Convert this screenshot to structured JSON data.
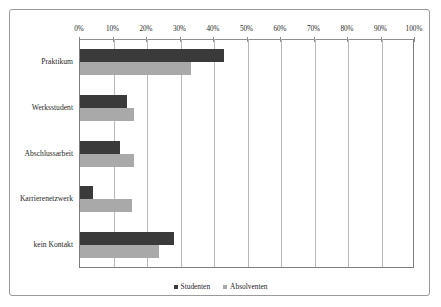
{
  "chart_data": {
    "type": "bar",
    "orientation": "horizontal",
    "title": "",
    "xlabel": "",
    "ylabel": "",
    "xlim": [
      0,
      100
    ],
    "grid": "vertical",
    "legend_position": "bottom",
    "xtick_labels": [
      "0%",
      "10%",
      "20%",
      "30%",
      "40%",
      "50%",
      "60%",
      "70%",
      "80%",
      "90%",
      "100%"
    ],
    "xtick_values": [
      0,
      10,
      20,
      30,
      40,
      50,
      60,
      70,
      80,
      90,
      100
    ],
    "categories": [
      "Praktikum",
      "Werksstudent",
      "Abschlussarbeit",
      "Karrierenetzwerk",
      "kein Kontakt"
    ],
    "series": [
      {
        "name": "Studenten",
        "color": "#3a3a3a",
        "values": [
          43,
          14,
          12,
          4,
          28
        ]
      },
      {
        "name": "Absolventen",
        "color": "#a9a9a9",
        "values": [
          33,
          16,
          16,
          15.5,
          23.5
        ]
      }
    ]
  },
  "legend": {
    "entries": [
      {
        "label": "Studenten",
        "color": "#3a3a3a"
      },
      {
        "label": "Absolventen",
        "color": "#a9a9a9"
      }
    ]
  }
}
